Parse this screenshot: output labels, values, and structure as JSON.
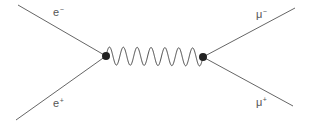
{
  "diagram": {
    "type": "feynman",
    "colors": {
      "line": "#666666",
      "vertex": "#222222",
      "label": "#555555"
    },
    "vertices": [
      {
        "id": "v1",
        "x": 106,
        "y": 56
      },
      {
        "id": "v2",
        "x": 203,
        "y": 57
      }
    ],
    "propagator": {
      "type": "photon",
      "style": "wavy",
      "from": "v1",
      "to": "v2",
      "oscillations": 7
    },
    "external_lines": [
      {
        "particle": "e-",
        "x": 18,
        "y": 5,
        "to": "v1"
      },
      {
        "particle": "e+",
        "x": 16,
        "y": 120,
        "to": "v1"
      },
      {
        "particle": "mu-",
        "x": 295,
        "y": 8,
        "to": "v2"
      },
      {
        "particle": "mu+",
        "x": 293,
        "y": 106,
        "to": "v2"
      }
    ],
    "labels": {
      "electron": {
        "base": "e",
        "charge": "−"
      },
      "positron": {
        "base": "e",
        "charge": "+"
      },
      "muon_minus": {
        "base": "μ",
        "charge": "−"
      },
      "muon_plus": {
        "base": "μ",
        "charge": "+"
      }
    }
  }
}
